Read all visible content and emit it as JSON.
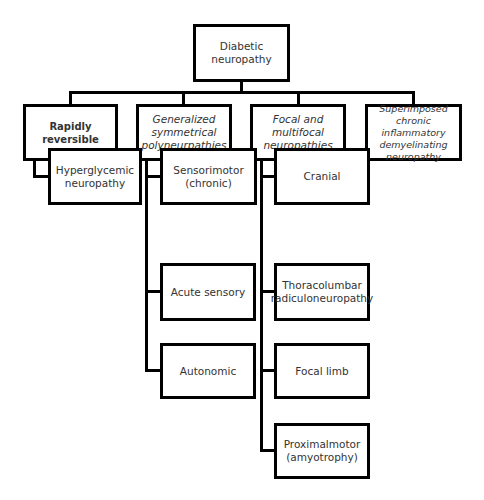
{
  "diagram": {
    "type": "tree",
    "root": {
      "label": "Diabetic neuropathy",
      "children": [
        {
          "label": "Rapidly reversible",
          "style": "bold",
          "children": [
            {
              "label": "Hyperglycemic neuropathy"
            }
          ]
        },
        {
          "label": "Generalized symmetrical polyneurpathies",
          "style": "italic",
          "children": [
            {
              "label": "Sensorimotor (chronic)"
            },
            {
              "label": "Acute sensory"
            },
            {
              "label": "Autonomic"
            }
          ]
        },
        {
          "label": "Focal and multifocal neuropathies",
          "style": "italic",
          "children": [
            {
              "label": "Cranial"
            },
            {
              "label": "Thoracolumbar radiculoneuropathy"
            },
            {
              "label": "Focal limb"
            },
            {
              "label": "Proximalmotor (amyotrophy)"
            }
          ]
        },
        {
          "label": "Superimposed chronic inflammatory demyelinating neuropathy",
          "style": "italic",
          "children": []
        }
      ]
    },
    "colors": {
      "border": "#000000",
      "text": "#333333",
      "background": "#ffffff"
    }
  },
  "nodes": {
    "root": "Diabetic neuropathy",
    "rapidly_reversible": "Rapidly reversible",
    "generalized": "Generalized symmetrical polyneurpathies",
    "focal": "Focal and multifocal neuropathies",
    "superimposed": "Superimposed chronic inflammatory demyelinating neuropathy",
    "hyperglycemic": "Hyperglycemic neuropathy",
    "sensorimotor": "Sensorimotor (chronic)",
    "acute_sensory": "Acute sensory",
    "autonomic": "Autonomic",
    "cranial": "Cranial",
    "thoracolumbar": "Thoracolumbar radiculoneuropathy",
    "focal_limb": "Focal limb",
    "proximalmotor": "Proximalmotor (amyotrophy)"
  }
}
